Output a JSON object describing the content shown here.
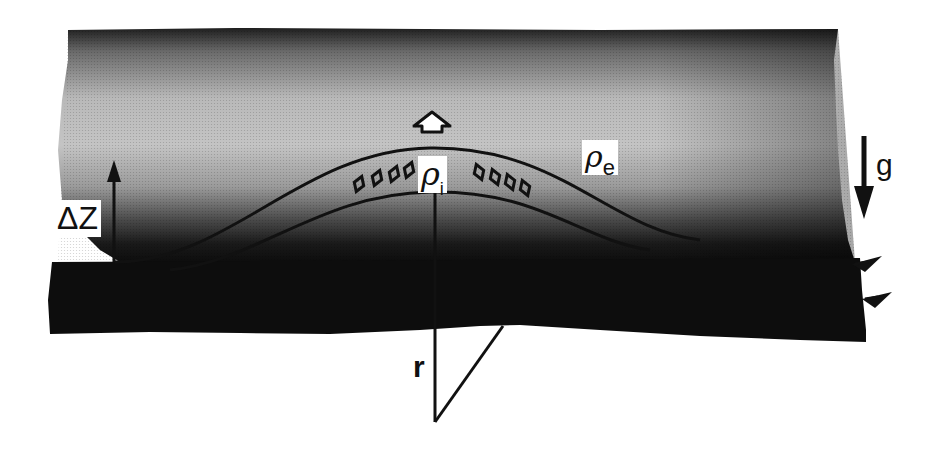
{
  "diagram": {
    "type": "cross-section",
    "layers": {
      "upper_medium": {
        "density_label": "ρ",
        "density_subscript": "e",
        "shading": "gradient dark-top to light then dark toward bottom"
      },
      "lower_medium": {
        "shading": "solid black"
      }
    },
    "lens": {
      "density_label": "ρ",
      "density_subscript": "i",
      "bubble_count_left": 4,
      "bubble_count_right": 4
    },
    "labels": {
      "delta_z": "ΔZ",
      "gravity": "g",
      "radius": "r",
      "rho": "ρ",
      "rho_i_sub": "i",
      "rho_e_sub": "e"
    },
    "arrows": {
      "upward_arrow": "buoyancy (hollow up arrow)",
      "delta_z_arrow": "up",
      "gravity_arrow": "down",
      "flow_arrows": 2
    },
    "colors": {
      "ink": "#111111",
      "background": "#ffffff",
      "dark": "#0d0d0d"
    }
  }
}
